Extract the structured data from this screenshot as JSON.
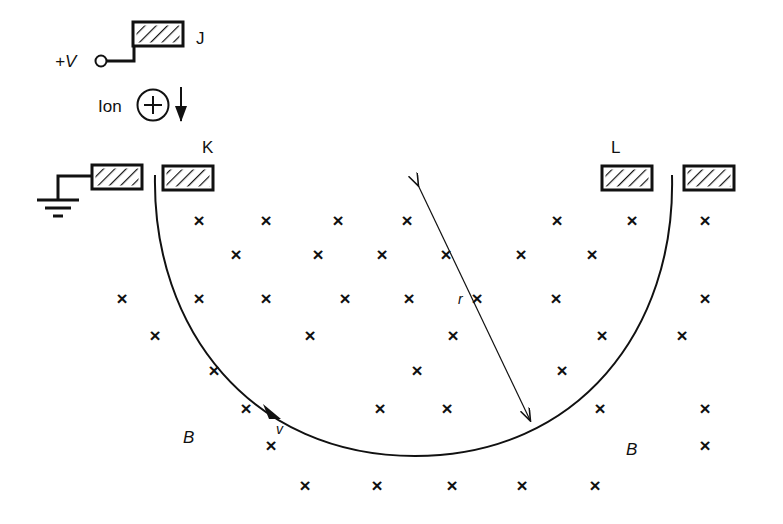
{
  "figure": {
    "background_color": "#ffffff",
    "ink_color": "#111111",
    "width": 783,
    "height": 524
  },
  "labels": {
    "plus_v": "+V",
    "plate_j": "J",
    "plate_k": "K",
    "plate_l": "L",
    "ion": "Ion",
    "ion_charge": "+",
    "radius": "r",
    "velocity": "v",
    "field_left": "B",
    "field_right": "B"
  },
  "icons": {
    "ground": "ground-symbol-icon",
    "terminal": "terminal-node-icon",
    "ion_circle": "ion-charge-circle-icon",
    "down_arrow": "ion-direction-arrow-icon",
    "radius_arrow": "radius-double-arrow-icon",
    "velocity_arrow": "velocity-tangent-arrow-icon",
    "field_mark": "magnetic-field-into-page-x-icon"
  },
  "geometry": {
    "arc": {
      "left_end": [
        155,
        175
      ],
      "right_end": [
        672,
        175
      ],
      "bottom": [
        415,
        456
      ],
      "description": "semicircular ion trajectory, concave up"
    },
    "radius_arrow": {
      "from": [
        418,
        185
      ],
      "to": [
        530,
        420
      ],
      "double_headed": true
    },
    "velocity_arrow": {
      "at": [
        272,
        412
      ],
      "direction": "tangent-clockwise-along-arc"
    },
    "plates": [
      {
        "name": "J",
        "x": 133,
        "y": 22,
        "w": 50,
        "h": 24
      },
      {
        "name": "ground-plate",
        "x": 92,
        "y": 165,
        "w": 50,
        "h": 24
      },
      {
        "name": "K",
        "x": 163,
        "y": 166,
        "w": 50,
        "h": 24
      },
      {
        "name": "L",
        "x": 602,
        "y": 166,
        "w": 50,
        "h": 24
      },
      {
        "name": "far-right-plate",
        "x": 684,
        "y": 166,
        "w": 50,
        "h": 24
      }
    ]
  },
  "field_marks": {
    "symbol": "×",
    "count": 43,
    "positions": [
      [
        199,
        222
      ],
      [
        266,
        222
      ],
      [
        338,
        222
      ],
      [
        407,
        222
      ],
      [
        557,
        222
      ],
      [
        632,
        222
      ],
      [
        705,
        222
      ],
      [
        236,
        256
      ],
      [
        318,
        256
      ],
      [
        382,
        256
      ],
      [
        446,
        256
      ],
      [
        521,
        256
      ],
      [
        592,
        256
      ],
      [
        122,
        300
      ],
      [
        199,
        300
      ],
      [
        266,
        300
      ],
      [
        345,
        300
      ],
      [
        409,
        300
      ],
      [
        477,
        300
      ],
      [
        556,
        300
      ],
      [
        705,
        300
      ],
      [
        155,
        337
      ],
      [
        310,
        337
      ],
      [
        453,
        337
      ],
      [
        602,
        337
      ],
      [
        682,
        337
      ],
      [
        214,
        372
      ],
      [
        417,
        372
      ],
      [
        562,
        372
      ],
      [
        246,
        410
      ],
      [
        380,
        410
      ],
      [
        447,
        410
      ],
      [
        600,
        410
      ],
      [
        705,
        410
      ],
      [
        271,
        447
      ],
      [
        705,
        447
      ],
      [
        305,
        487
      ],
      [
        377,
        487
      ],
      [
        452,
        487
      ],
      [
        522,
        487
      ],
      [
        595,
        487
      ]
    ]
  }
}
